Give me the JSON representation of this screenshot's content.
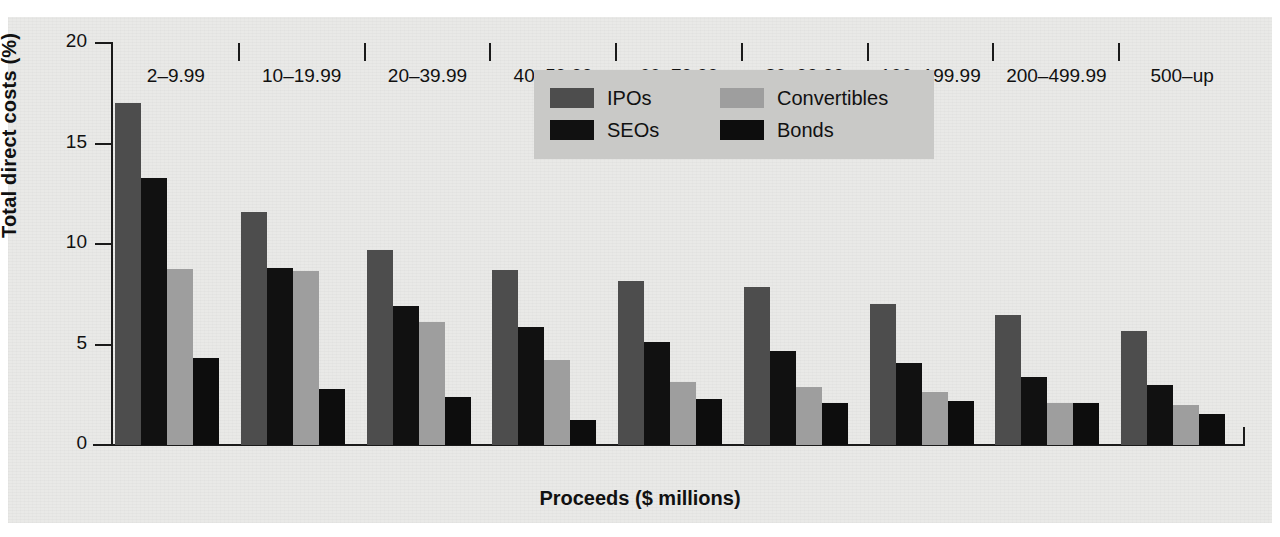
{
  "chart_data": {
    "type": "bar",
    "title": "",
    "xlabel": "Proceeds ($ millions)",
    "ylabel": "Total direct costs (%)",
    "ylim": [
      0,
      20
    ],
    "yticks": [
      0,
      5,
      10,
      15,
      20
    ],
    "ytick_labels": [
      "0",
      "5",
      "10",
      "15",
      "20"
    ],
    "grid": false,
    "legend_position": "top-center",
    "categories": [
      "2–9.99",
      "10–19.99",
      "20–39.99",
      "40–59.99",
      "60–79.99",
      "80–99.99",
      "100–199.99",
      "200–499.99",
      "500–up"
    ],
    "series": [
      {
        "name": "IPOs",
        "color": "#4d4d4d",
        "values": [
          17.0,
          11.6,
          9.7,
          8.7,
          8.15,
          7.85,
          7.0,
          6.45,
          5.65
        ]
      },
      {
        "name": "SEOs",
        "color": "#111111",
        "values": [
          13.3,
          8.8,
          6.9,
          5.85,
          5.15,
          4.7,
          4.1,
          3.4,
          3.0
        ]
      },
      {
        "name": "Convertibles",
        "color": "#9e9e9e",
        "values": [
          8.75,
          8.65,
          6.1,
          4.25,
          3.15,
          2.9,
          2.65,
          2.1,
          2.0
        ]
      },
      {
        "name": "Bonds",
        "color": "#0d0d0d",
        "values": [
          4.35,
          2.8,
          2.4,
          1.25,
          2.3,
          2.1,
          2.2,
          2.1,
          1.55
        ]
      }
    ]
  },
  "legend": {
    "entries": [
      {
        "label": "IPOs",
        "color": "#4d4d4d"
      },
      {
        "label": "Convertibles",
        "color": "#9e9e9e"
      },
      {
        "label": "SEOs",
        "color": "#111111"
      },
      {
        "label": "Bonds",
        "color": "#0d0d0d"
      }
    ],
    "background": "#c9c9c7"
  }
}
